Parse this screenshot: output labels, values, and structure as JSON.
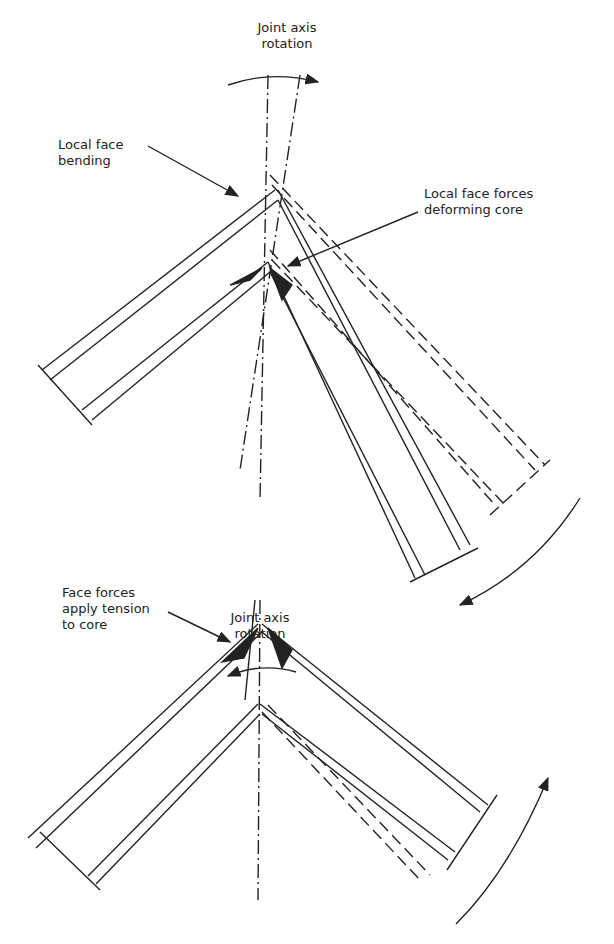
{
  "diagram": {
    "top": {
      "axis_label": "Joint axis\nrotation",
      "callout_left": "Local face\nbending",
      "callout_right": "Local face forces\ndeforming core",
      "rotation_direction": "clockwise"
    },
    "bottom": {
      "axis_label": "Joint axis\nrotation",
      "callout_left": "Face forces\napply tension\nto core",
      "rotation_direction": "counter-clockwise"
    },
    "colors": {
      "ink": "#222222",
      "background": "#ffffff"
    }
  }
}
